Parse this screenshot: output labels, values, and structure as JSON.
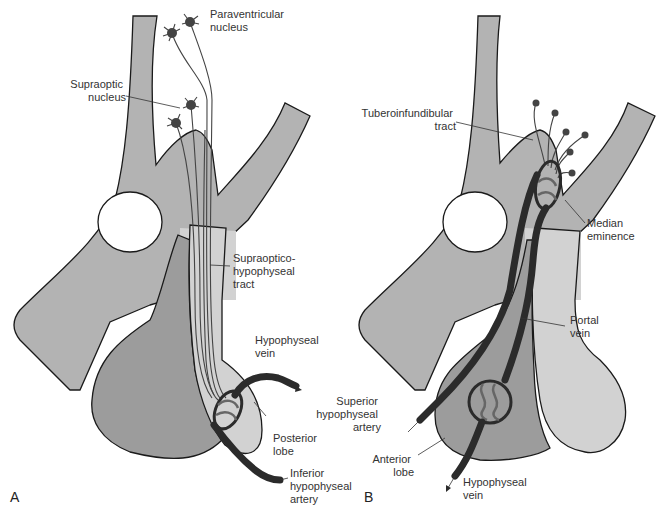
{
  "colors": {
    "tissue": "#b3b3b3",
    "tissue_light": "#d2d2d2",
    "anterior_lobe": "#9c9c9c",
    "neuron": "#444444",
    "vessel": "#2b2b2b",
    "text": "#333333"
  },
  "panel_a": {
    "panel_label": "A",
    "labels": {
      "paraventricular": [
        "Paraventricular",
        "nucleus"
      ],
      "supraoptic": [
        "Supraoptic",
        "nucleus"
      ],
      "tract": [
        "Supraoptico-",
        "hypophyseal",
        "tract"
      ],
      "hypophyseal_vein": [
        "Hypophyseal",
        "vein"
      ],
      "posterior_lobe": [
        "Posterior",
        "lobe"
      ],
      "inferior_artery": [
        "Inferior",
        "hypophyseal",
        "artery"
      ]
    }
  },
  "panel_b": {
    "panel_label": "B",
    "labels": {
      "tuberoinfundibular": [
        "Tuberoinfundibular",
        "tract"
      ],
      "median_eminence": [
        "Median",
        "eminence"
      ],
      "portal_vein": [
        "Portal",
        "vein"
      ],
      "superior_artery": [
        "Superior",
        "hypophyseal",
        "artery"
      ],
      "anterior_lobe": [
        "Anterior",
        "lobe"
      ],
      "hypophyseal_vein": [
        "Hypophyseal",
        "vein"
      ]
    }
  }
}
